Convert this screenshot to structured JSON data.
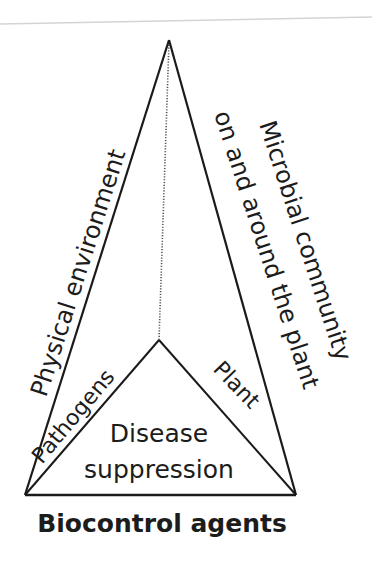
{
  "diagram": {
    "type": "disease-tetrahedron",
    "colors": {
      "line": "#1a1a1a",
      "text": "#1c1c1c",
      "background": "#ffffff",
      "scan_edge": "#d4d4d4"
    },
    "vertices": {
      "apex": [
        169,
        40
      ],
      "inner": [
        159,
        340
      ],
      "bottom_left": [
        25,
        495
      ],
      "bottom_right": [
        296,
        495
      ]
    },
    "edges": {
      "left_outer": "Physical environment",
      "right_outer_line1": "Microbial community",
      "right_outer_line2": "on and around the plant",
      "inner_left": "Pathogens",
      "inner_right": "Plant",
      "base": "Biocontrol agents"
    },
    "center": {
      "line1": "Disease",
      "line2": "suppression"
    }
  }
}
